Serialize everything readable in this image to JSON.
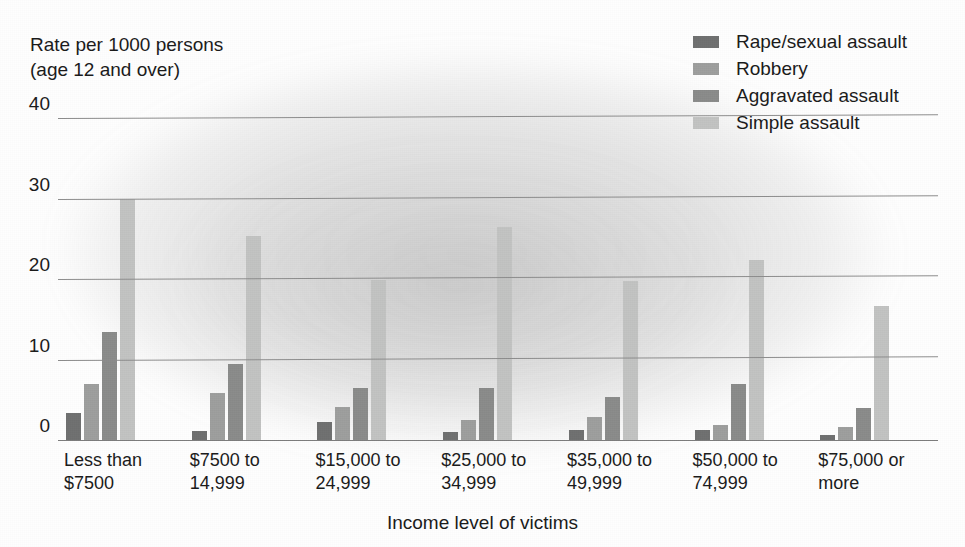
{
  "chart_data": {
    "type": "bar",
    "title": "",
    "xlabel": "Income level of victims",
    "ylabel": "Rate per 1000 persons\n(age 12 and over)",
    "ylim": [
      0,
      40
    ],
    "yticks": [
      0,
      10,
      20,
      30,
      40
    ],
    "grid": true,
    "legend_position": "top-right",
    "categories": [
      "Less than\n$7500",
      "$7500 to\n14,999",
      "$15,000 to\n24,999",
      "$25,000 to\n34,999",
      "$35,000 to\n49,999",
      "$50,000 to\n74,999",
      "$75,000 or\nmore"
    ],
    "series": [
      {
        "name": "Rape/sexual assault",
        "color": "#6f7070",
        "values": [
          3.3,
          1.1,
          2.2,
          1.0,
          1.2,
          1.3,
          0.6
        ]
      },
      {
        "name": "Robbery",
        "color": "#9d9e9d",
        "values": [
          7.0,
          5.9,
          4.1,
          2.5,
          2.9,
          1.9,
          1.6
        ]
      },
      {
        "name": "Aggravated assault",
        "color": "#8a8b8a",
        "values": [
          13.4,
          9.4,
          6.5,
          6.5,
          5.3,
          7.0,
          4.0
        ]
      },
      {
        "name": "Simple assault",
        "color": "#c2c3c2",
        "values": [
          30.0,
          25.3,
          19.9,
          26.4,
          19.8,
          22.4,
          16.6
        ]
      }
    ]
  }
}
